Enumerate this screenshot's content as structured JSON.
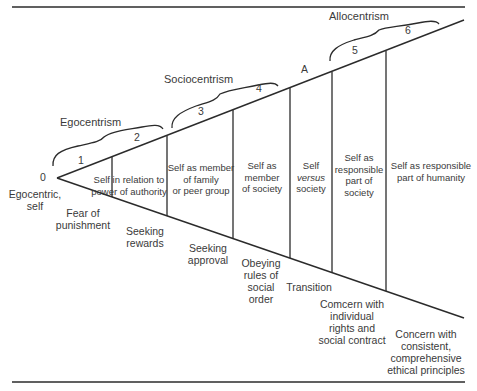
{
  "diagram": {
    "groups": [
      {
        "label": "Egocentrism"
      },
      {
        "label": "Sociocentrism"
      },
      {
        "label": "Allocentrism"
      }
    ],
    "stage_numbers": [
      "0",
      "1",
      "2",
      "3",
      "4",
      "A",
      "5",
      "6"
    ],
    "origin_label": [
      "Egocentric,",
      "self"
    ],
    "regions": [
      {
        "lines": [
          "Self in relation to",
          "power of authority"
        ]
      },
      {
        "lines": [
          "Self as member",
          "of family",
          "or peer group"
        ]
      },
      {
        "lines": [
          "Self as",
          "member",
          "of society"
        ]
      },
      {
        "lines": [
          "Self",
          "versus",
          "society"
        ]
      },
      {
        "lines": [
          "Self as",
          "responsible",
          "part of",
          "society"
        ]
      },
      {
        "lines": [
          "Self as responsible",
          "part of humanity"
        ]
      }
    ],
    "motivations": [
      {
        "lines": [
          "Fear of",
          "punishment"
        ]
      },
      {
        "lines": [
          "Seeking",
          "rewards"
        ]
      },
      {
        "lines": [
          "Seeking",
          "approval"
        ]
      },
      {
        "lines": [
          "Obeying",
          "rules of",
          "social",
          "order"
        ]
      },
      {
        "lines": [
          "Transition"
        ]
      },
      {
        "lines": [
          "Comcern with",
          "individual",
          "rights and",
          "social contract"
        ]
      },
      {
        "lines": [
          "Concern with",
          "consistent,",
          "comprehensive",
          "ethical principles"
        ]
      }
    ],
    "line_color": "#2b2b2b"
  }
}
